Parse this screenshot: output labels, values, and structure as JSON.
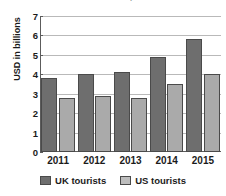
{
  "chart_data": {
    "type": "bar",
    "title": "US tourists to UK, 2011-2015",
    "xlabel": "",
    "ylabel": "USD in billions",
    "categories": [
      "2011",
      "2012",
      "2013",
      "2014",
      "2015"
    ],
    "yticks": [
      "0",
      "1",
      "2",
      "3",
      "4",
      "5",
      "6",
      "7"
    ],
    "ylim": [
      0,
      7
    ],
    "grid": true,
    "legend_position": "bottom",
    "series": [
      {
        "name": "UK tourists",
        "color": "#6e6e6e",
        "values": [
          3.8,
          4.0,
          4.1,
          4.9,
          5.8
        ]
      },
      {
        "name": "US tourists",
        "color": "#aaaaaa",
        "values": [
          2.8,
          2.9,
          2.8,
          3.5,
          4.0
        ]
      }
    ]
  }
}
